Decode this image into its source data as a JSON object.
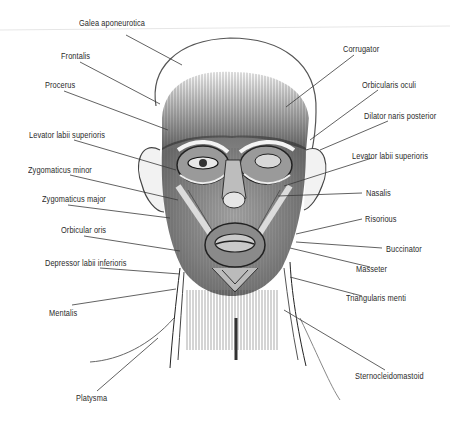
{
  "figure": {
    "colors": {
      "background": "#ffffff",
      "ink": "#2a2a2a",
      "leader": "#3a3a3a"
    }
  },
  "labels": {
    "left": [
      {
        "id": "galea",
        "text": "Galea aponeurotica",
        "x": 79,
        "y": 23
      },
      {
        "id": "frontalis",
        "text": "Frontalis",
        "x": 61,
        "y": 54
      },
      {
        "id": "procerus",
        "text": "Procerus",
        "x": 45,
        "y": 82
      },
      {
        "id": "levator-left",
        "text": "Levator labii superioris",
        "x": 29,
        "y": 131
      },
      {
        "id": "zyg-minor",
        "text": "Zygomaticus minor",
        "x": 28,
        "y": 166
      },
      {
        "id": "zyg-major",
        "text": "Zygomaticus major",
        "x": 42,
        "y": 195
      },
      {
        "id": "orbicular-oris",
        "text": "Orbicular oris",
        "x": 61,
        "y": 226
      },
      {
        "id": "depressor",
        "text": "Depressor labii inferioris",
        "x": 45,
        "y": 259
      },
      {
        "id": "mentalis",
        "text": "Mentalis",
        "x": 49,
        "y": 308
      },
      {
        "id": "platysma",
        "text": "Platysma",
        "x": 76,
        "y": 392
      }
    ],
    "right": [
      {
        "id": "corrugator",
        "text": "Corrugator",
        "x": 343,
        "y": 45
      },
      {
        "id": "orbicularis-oculi",
        "text": "Orbicularis oculi",
        "x": 362,
        "y": 80
      },
      {
        "id": "dilator",
        "text": "Dilator naris posterior",
        "x": 364,
        "y": 111
      },
      {
        "id": "levator-right",
        "text": "Levator labii superioris",
        "x": 352,
        "y": 151
      },
      {
        "id": "nasalis",
        "text": "Nasalis",
        "x": 366,
        "y": 188
      },
      {
        "id": "risorious",
        "text": "Risorious",
        "x": 365,
        "y": 214
      },
      {
        "id": "buccinator",
        "text": "Buccinator",
        "x": 386,
        "y": 244
      },
      {
        "id": "masseter",
        "text": "Masseter",
        "x": 356,
        "y": 264
      },
      {
        "id": "triangularis",
        "text": "Triangularis menti",
        "x": 346,
        "y": 297
      },
      {
        "id": "sterno",
        "text": "Sternocleidomastoid",
        "x": 355,
        "y": 374
      }
    ]
  }
}
